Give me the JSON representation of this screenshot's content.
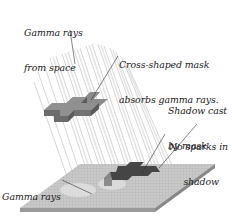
{
  "diagram": {
    "colors": {
      "background": "#ffffff",
      "rays": "#b8b8b8",
      "mask_top": "#8f8f8f",
      "mask_side_front": "#6f6f6f",
      "mask_side_right": "#5e5e5e",
      "plate_top": "#c9c9c9",
      "plate_grid": "#a9a9a9",
      "plate_edge": "#8a8a8a",
      "shadow": "#3c3c3c",
      "leader_line": "#333333",
      "text": "#1a1a1a"
    },
    "labels": [
      {
        "id": "gamma-rays-from-space",
        "lines": [
          "Gamma rays",
          "from space"
        ]
      },
      {
        "id": "cross-mask",
        "lines": [
          "Cross-shaped mask",
          "absorbs gamma rays."
        ]
      },
      {
        "id": "shadow-cast",
        "lines": [
          "Shadow cast",
          "by mask"
        ]
      },
      {
        "id": "no-sparks",
        "lines": [
          "No sparks in",
          "     shadow"
        ]
      },
      {
        "id": "trigger-sparks",
        "lines": [
          "Gamma rays",
          "trigger sparks."
        ]
      }
    ]
  }
}
